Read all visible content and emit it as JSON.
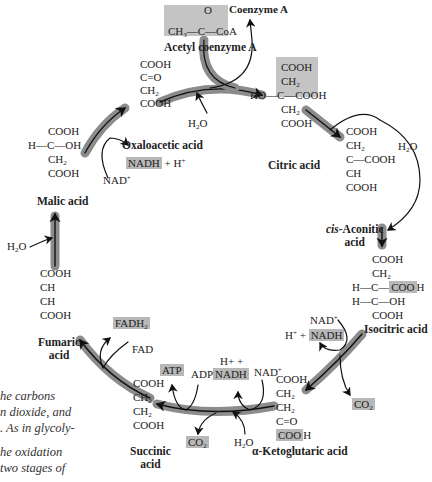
{
  "diagram": {
    "acetyl_coa": {
      "formula_top": "O",
      "formula": "CH3—C—CoA",
      "label": "Acetyl coenzyme A"
    },
    "coenzyme_a": "Coenzyme A",
    "molecules": {
      "oxaloacetic": {
        "label": "Oxaloacetic acid",
        "lines": [
          "COOH",
          "C=O",
          "CH2",
          "COOH"
        ]
      },
      "citric": {
        "label": "Citric acid",
        "lines": [
          "COOH",
          "CH2",
          "HO—C—COOH",
          "CH2",
          "COOH"
        ]
      },
      "cis_aconitic": {
        "label_italic": "cis",
        "label_rest": "-Aconitic",
        "label_line2": "acid",
        "lines": [
          "COOH",
          "CH2",
          "C—COOH",
          "CH",
          "COOH"
        ]
      },
      "isocitric": {
        "label": "Isocitric acid",
        "lines": [
          "COOH",
          "CH2",
          "H—C—COOH",
          "H—C—OH",
          "COOH"
        ]
      },
      "alpha_ketoglutaric": {
        "label": "α-Ketoglutaric acid",
        "lines": [
          "COOH",
          "CH2",
          "CH2",
          "C=O",
          "COOH"
        ]
      },
      "succinic": {
        "label": "Succinic",
        "label_line2": "acid",
        "lines": [
          "COOH",
          "CH2",
          "CH2",
          "COOH"
        ]
      },
      "fumaric": {
        "label": "Fumaric",
        "label_line2": "acid",
        "lines": [
          "COOH",
          "CH",
          "CH",
          "COOH"
        ]
      },
      "malic": {
        "label": "Malic acid",
        "lines": [
          "COOH",
          "H—C—OH",
          "CH2",
          "COOH"
        ]
      }
    },
    "cofactors": {
      "h2o_1": "H2O",
      "h2o_2": "H2O",
      "h2o_3": "H2O",
      "h2o_4": "H2O",
      "nadh_1": "NADH",
      "h_plus_1": "+ H+",
      "nad_1": "NAD+",
      "nad_2": "NAD+",
      "h_plus_2": "H+ +",
      "nadh_2": "NADH",
      "co2_1": "CO2",
      "nad_3": "NAD+",
      "h_plus_3": "H+ +",
      "nadh_3": "NADH",
      "co2_2": "CO2",
      "atp": "ATP",
      "adp": "ADP",
      "fadh2": "FADH2",
      "fad": "FAD"
    },
    "caption_lines": [
      "he carbons",
      "n dioxide, and",
      ". As in glycoly-",
      "",
      "he oxidation",
      "two stages of"
    ],
    "colors": {
      "highlight": "#c4c4c4",
      "arrow_band": "#8c8c8c",
      "arrow_line": "#111111",
      "text": "#222222"
    }
  }
}
